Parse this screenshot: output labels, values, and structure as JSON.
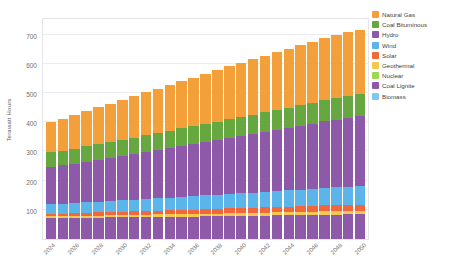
{
  "chart_data": {
    "type": "bar",
    "stacked": true,
    "title": "",
    "subtitle": "",
    "xlabel": "",
    "ylabel": "Terawatt Hours",
    "ylim": [
      0,
      760
    ],
    "yticks": [
      100,
      200,
      300,
      400,
      500,
      600,
      700
    ],
    "grid": true,
    "legend_position": "right",
    "x": [
      "2024",
      "2025",
      "2026",
      "2027",
      "2028",
      "2029",
      "2030",
      "2031",
      "2032",
      "2033",
      "2034",
      "2035",
      "2036",
      "2037",
      "2038",
      "2039",
      "2040",
      "2041",
      "2042",
      "2043",
      "2044",
      "2045",
      "2046",
      "2047",
      "2048",
      "2049",
      "2050"
    ],
    "tick_labels": [
      "2024",
      "",
      "2026",
      "",
      "2028",
      "",
      "2030",
      "",
      "2032",
      "",
      "2034",
      "",
      "2036",
      "",
      "2038",
      "",
      "2040",
      "",
      "2042",
      "",
      "2044",
      "",
      "2046",
      "",
      "2048",
      "",
      "2050"
    ],
    "series": [
      {
        "name": "Coal Lignite",
        "color": "#8e59a8",
        "values": [
          72,
          72,
          72,
          73,
          73,
          74,
          74,
          75,
          75,
          76,
          76,
          77,
          77,
          78,
          78,
          79,
          79,
          80,
          80,
          81,
          81,
          82,
          82,
          83,
          83,
          84,
          84
        ]
      },
      {
        "name": "Geothermal",
        "color": "#f2c94c",
        "values": [
          6,
          6,
          6,
          7,
          7,
          7,
          7,
          8,
          8,
          8,
          8,
          9,
          9,
          9,
          9,
          10,
          10,
          10,
          10,
          11,
          11,
          11,
          11,
          12,
          12,
          12,
          12
        ]
      },
      {
        "name": "Solar",
        "color": "#f2663c",
        "values": [
          9,
          9,
          10,
          10,
          11,
          11,
          12,
          12,
          13,
          13,
          14,
          14,
          15,
          15,
          16,
          16,
          17,
          17,
          18,
          18,
          19,
          19,
          20,
          20,
          21,
          21,
          22
        ]
      },
      {
        "name": "Wind",
        "color": "#5bb4ea",
        "values": [
          33,
          34,
          35,
          36,
          37,
          38,
          39,
          40,
          42,
          43,
          44,
          45,
          46,
          48,
          49,
          50,
          51,
          52,
          54,
          55,
          56,
          57,
          58,
          60,
          61,
          62,
          63
        ]
      },
      {
        "name": "Hydro",
        "color": "#8e59a8",
        "values": [
          128,
          131,
          135,
          139,
          143,
          147,
          151,
          156,
          160,
          165,
          169,
          174,
          178,
          183,
          187,
          192,
          196,
          201,
          205,
          210,
          214,
          219,
          223,
          228,
          232,
          237,
          241
        ]
      },
      {
        "name": "Nuclear",
        "color": "#9ed84f",
        "values": [
          0,
          0,
          0,
          0,
          0,
          0,
          0,
          0,
          0,
          0,
          0,
          0,
          0,
          0,
          0,
          0,
          0,
          0,
          0,
          0,
          0,
          0,
          0,
          0,
          0,
          0,
          0
        ]
      },
      {
        "name": "Biomass",
        "color": "#7ec8f0",
        "values": [
          0,
          0,
          0,
          0,
          0,
          0,
          0,
          0,
          0,
          0,
          0,
          0,
          0,
          0,
          0,
          0,
          0,
          0,
          0,
          0,
          0,
          0,
          0,
          0,
          0,
          0,
          0
        ]
      },
      {
        "name": "Coal Bituminous",
        "color": "#66a83f",
        "values": [
          49,
          50,
          51,
          52,
          53,
          54,
          55,
          56,
          57,
          58,
          59,
          60,
          61,
          62,
          63,
          64,
          65,
          66,
          67,
          68,
          69,
          70,
          71,
          72,
          73,
          74,
          75
        ]
      },
      {
        "name": "Natural Gas",
        "color": "#f4a03a",
        "values": [
          104,
          110,
          116,
          122,
          127,
          133,
          138,
          142,
          147,
          152,
          157,
          162,
          167,
          171,
          176,
          181,
          186,
          190,
          194,
          198,
          202,
          206,
          209,
          212,
          215,
          218,
          220
        ]
      }
    ],
    "stack_order_bottom_to_top": [
      "Coal Lignite",
      "Geothermal",
      "Solar",
      "Wind",
      "Hydro",
      "Nuclear",
      "Biomass",
      "Coal Bituminous",
      "Natural Gas"
    ],
    "totals": [
      401,
      412,
      425,
      439,
      451,
      464,
      476,
      489,
      502,
      515,
      527,
      541,
      553,
      566,
      578,
      592,
      604,
      616,
      628,
      641,
      652,
      664,
      674,
      687,
      697,
      710,
      717
    ]
  },
  "legend": {
    "items": [
      {
        "label": "Natural Gas",
        "color": "#f4a03a"
      },
      {
        "label": "Coal Bituminous",
        "color": "#66a83f"
      },
      {
        "label": "Hydro",
        "color": "#8e59a8"
      },
      {
        "label": "Wind",
        "color": "#5bb4ea"
      },
      {
        "label": "Solar",
        "color": "#f2663c"
      },
      {
        "label": "Geothermal",
        "color": "#f2c94c"
      },
      {
        "label": "Nuclear",
        "color": "#9ed84f"
      },
      {
        "label": "Coal Lignite",
        "color": "#8e59a8"
      },
      {
        "label": "Biomass",
        "color": "#7ec8f0"
      }
    ]
  }
}
